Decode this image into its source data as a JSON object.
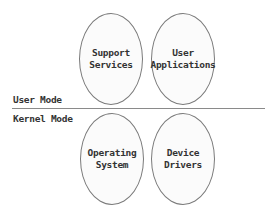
{
  "diagram": {
    "user_mode": {
      "label": "User Mode",
      "components": [
        {
          "label": "Support\nServices"
        },
        {
          "label": "User\nApplications"
        }
      ]
    },
    "kernel_mode": {
      "label": "Kernel Mode",
      "components": [
        {
          "label": "Operating\nSystem"
        },
        {
          "label": "Device\nDrivers"
        }
      ]
    }
  }
}
